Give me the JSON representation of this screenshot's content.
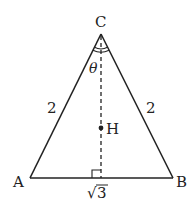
{
  "diagram": {
    "type": "isosceles-triangle",
    "vertices": {
      "A": {
        "label": "A"
      },
      "B": {
        "label": "B"
      },
      "C": {
        "label": "C"
      }
    },
    "point_H": {
      "label": "H"
    },
    "angle_label": "θ",
    "side_labels": {
      "CA": "2",
      "CB": "2",
      "AB_root_symbol": "√",
      "AB_radicand": "3"
    },
    "colors": {
      "stroke": "#222222",
      "background": "#ffffff"
    }
  }
}
